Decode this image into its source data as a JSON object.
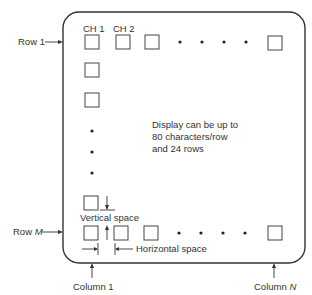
{
  "diagram": {
    "row_labels": {
      "first": "Row 1",
      "last_prefix": "Row ",
      "last_var": "M"
    },
    "column_labels": {
      "first": "Column 1",
      "last_prefix": "Column ",
      "last_var": "N"
    },
    "channel_labels": [
      "CH 1",
      "CH 2"
    ],
    "annotation": {
      "lines": [
        "Display can be up to",
        "80 characters/row",
        "and 24 rows"
      ]
    },
    "spacing_labels": {
      "vertical": "Vertical space",
      "horizontal": "Horizontal space"
    },
    "ellipsis_dot_count_horizontal": 4,
    "ellipsis_dot_count_vertical": 3,
    "colors": {
      "line": "#333333",
      "box": "#444444",
      "background": "#ffffff"
    }
  }
}
